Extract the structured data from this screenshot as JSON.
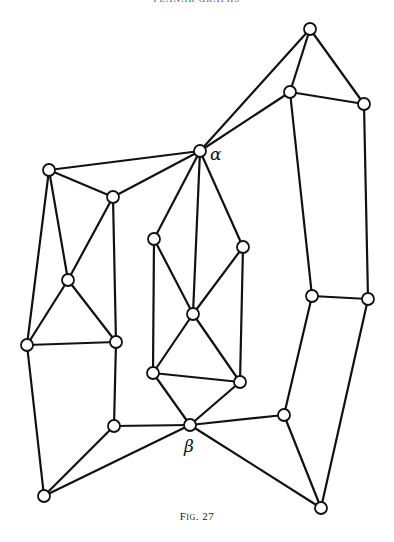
{
  "header": {
    "text": "PLANAR GRAPHS"
  },
  "figure": {
    "caption": "Fig. 27",
    "labels": {
      "alpha": "α",
      "beta": "β"
    }
  },
  "graph": {
    "nodes": [
      {
        "id": "top",
        "x": 310,
        "y": 29
      },
      {
        "id": "ur1",
        "x": 290,
        "y": 92
      },
      {
        "id": "ur2",
        "x": 364,
        "y": 104
      },
      {
        "id": "alpha",
        "x": 200,
        "y": 151,
        "label": "α"
      },
      {
        "id": "l1",
        "x": 49,
        "y": 170
      },
      {
        "id": "l2",
        "x": 113,
        "y": 197
      },
      {
        "id": "m1",
        "x": 154,
        "y": 239
      },
      {
        "id": "m2",
        "x": 243,
        "y": 247
      },
      {
        "id": "l3",
        "x": 68,
        "y": 280
      },
      {
        "id": "r1",
        "x": 312,
        "y": 296
      },
      {
        "id": "r2",
        "x": 368,
        "y": 299
      },
      {
        "id": "m3",
        "x": 193,
        "y": 314
      },
      {
        "id": "l4",
        "x": 116,
        "y": 342
      },
      {
        "id": "l5",
        "x": 27,
        "y": 345
      },
      {
        "id": "m4",
        "x": 153,
        "y": 373
      },
      {
        "id": "m5",
        "x": 240,
        "y": 382
      },
      {
        "id": "r3",
        "x": 284,
        "y": 415
      },
      {
        "id": "beta",
        "x": 190,
        "y": 425,
        "label": "β"
      },
      {
        "id": "l6",
        "x": 114,
        "y": 426
      },
      {
        "id": "bl",
        "x": 44,
        "y": 496
      },
      {
        "id": "br",
        "x": 321,
        "y": 508
      }
    ],
    "edges": [
      [
        "top",
        "ur1"
      ],
      [
        "top",
        "ur2"
      ],
      [
        "top",
        "alpha"
      ],
      [
        "ur1",
        "alpha"
      ],
      [
        "ur1",
        "ur2"
      ],
      [
        "ur1",
        "r1"
      ],
      [
        "ur2",
        "r2"
      ],
      [
        "r1",
        "r2"
      ],
      [
        "r1",
        "r3"
      ],
      [
        "r2",
        "br"
      ],
      [
        "r3",
        "br"
      ],
      [
        "r3",
        "beta"
      ],
      [
        "beta",
        "br"
      ],
      [
        "alpha",
        "l1"
      ],
      [
        "alpha",
        "l2"
      ],
      [
        "alpha",
        "m1"
      ],
      [
        "alpha",
        "m3"
      ],
      [
        "alpha",
        "m2"
      ],
      [
        "l1",
        "l2"
      ],
      [
        "l1",
        "l3"
      ],
      [
        "l1",
        "l5"
      ],
      [
        "l2",
        "l3"
      ],
      [
        "l2",
        "l4"
      ],
      [
        "l3",
        "l5"
      ],
      [
        "l3",
        "l4"
      ],
      [
        "l5",
        "l4"
      ],
      [
        "l5",
        "bl"
      ],
      [
        "l4",
        "l6"
      ],
      [
        "l6",
        "beta"
      ],
      [
        "l6",
        "bl"
      ],
      [
        "bl",
        "beta"
      ],
      [
        "m1",
        "m3"
      ],
      [
        "m1",
        "m4"
      ],
      [
        "m2",
        "m3"
      ],
      [
        "m2",
        "m5"
      ],
      [
        "m3",
        "m4"
      ],
      [
        "m3",
        "m5"
      ],
      [
        "m4",
        "m5"
      ],
      [
        "m4",
        "beta"
      ],
      [
        "m5",
        "beta"
      ]
    ]
  }
}
